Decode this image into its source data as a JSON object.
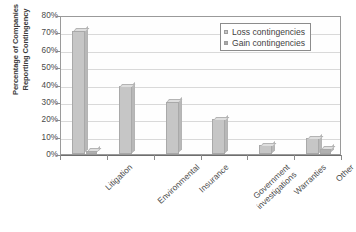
{
  "chart_data": {
    "type": "bar",
    "title": "",
    "xlabel": "",
    "ylabel": "Percentage of Companies Reporting Contingency",
    "ylim": [
      0,
      80
    ],
    "ytick_labels": [
      "80%",
      "70%",
      "60%",
      "50%",
      "40%",
      "30%",
      "20%",
      "10%",
      "0%"
    ],
    "ytick_values": [
      80,
      70,
      60,
      50,
      40,
      30,
      20,
      10,
      0
    ],
    "grid": true,
    "legend_position": "top-right",
    "categories": [
      "Litigation",
      "Environmental",
      "Insurance",
      "Government investigations",
      "Warranties",
      "Other"
    ],
    "series": [
      {
        "name": "Loss contingencies",
        "color": "#c6c6c6",
        "values": [
          71,
          39,
          30,
          20,
          5,
          9
        ]
      },
      {
        "name": "Gain contingencies",
        "color": "#b0b0b0",
        "values": [
          2,
          0,
          0,
          0,
          0,
          3
        ]
      }
    ]
  },
  "axis": {
    "y_title_line1": "Percentage of Companies",
    "y_title_line2": "Reporting Contingency",
    "x_labels": [
      {
        "line1": "Litigation",
        "line2": ""
      },
      {
        "line1": "Environmental",
        "line2": ""
      },
      {
        "line1": "Insurance",
        "line2": ""
      },
      {
        "line1": "Government",
        "line2": "investigations"
      },
      {
        "line1": "Warranties",
        "line2": ""
      },
      {
        "line1": "Other",
        "line2": ""
      }
    ]
  },
  "legend": {
    "items": [
      {
        "label": "Loss contingencies",
        "swatch": "#c6c6c6"
      },
      {
        "label": "Gain contingencies",
        "swatch": "#a8a8a8"
      }
    ]
  },
  "colors": {
    "loss_bar": "#c6c6c6",
    "gain_bar": "#aeaeae",
    "gridline": "#d9d9d9",
    "frame": "#9a9a9a",
    "text": "#4d4d4d"
  }
}
